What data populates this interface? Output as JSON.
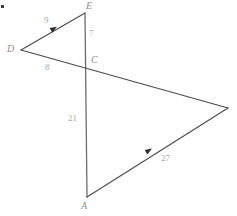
{
  "figure": {
    "width": 237,
    "height": 216,
    "background_color": "#ffffff",
    "line_color": "#4a4a4a",
    "vertical_line_color": "#6b6b6b",
    "label_color": "#8e8e8e",
    "length_label_color": "#a9a9a9"
  },
  "vertices": [
    {
      "name": "E",
      "label": "E",
      "x": 85,
      "y": 13,
      "label_x": 86,
      "label_y": 1,
      "labeled": true
    },
    {
      "name": "D",
      "label": "D",
      "x": 21,
      "y": 50,
      "label_x": 7,
      "label_y": 44,
      "labeled": true
    },
    {
      "name": "C",
      "label": "C",
      "x": 86,
      "y": 63,
      "label_x": 91,
      "label_y": 55,
      "labeled": true
    },
    {
      "name": "A",
      "label": "A",
      "x": 87,
      "y": 197,
      "label_x": 81,
      "label_y": 201,
      "labeled": true
    },
    {
      "name": "B",
      "label": "",
      "x": 228,
      "y": 108,
      "label_x": 0,
      "label_y": 0,
      "labeled": false
    }
  ],
  "segments": [
    {
      "name": "DE",
      "from": "D",
      "to": "E",
      "x1": 21,
      "y1": 50,
      "x2": 85,
      "y2": 13,
      "color": "#4a4a4a",
      "width": 1.1
    },
    {
      "name": "EA",
      "from": "E",
      "to": "A",
      "x1": 85,
      "y1": 13,
      "x2": 87,
      "y2": 197,
      "color": "#6b6b6b",
      "width": 1.3
    },
    {
      "name": "DB",
      "from": "D",
      "to": "B",
      "x1": 21,
      "y1": 50,
      "x2": 228,
      "y2": 108,
      "color": "#4a4a4a",
      "width": 1.1
    },
    {
      "name": "AB",
      "from": "A",
      "to": "B",
      "x1": 87,
      "y1": 197,
      "x2": 228,
      "y2": 108,
      "color": "#4a4a4a",
      "width": 1.1
    }
  ],
  "length_labels": [
    {
      "name": "DE",
      "value": "9",
      "x": 44,
      "y": 16
    },
    {
      "name": "EC",
      "value": "7",
      "x": 89,
      "y": 29
    },
    {
      "name": "DC",
      "value": "8",
      "x": 45,
      "y": 63
    },
    {
      "name": "CA",
      "value": "21",
      "x": 68,
      "y": 114
    },
    {
      "name": "AB",
      "value": "27",
      "x": 161,
      "y": 154
    }
  ],
  "tick_markers": [
    {
      "name": "marker-on-DE",
      "x": 57,
      "y": 26.8,
      "angle": -30
    },
    {
      "name": "marker-on-AB",
      "x": 152,
      "y": 148.5,
      "angle": -32
    }
  ],
  "corner_artifact": {
    "name": "corner-dot",
    "present": true
  }
}
